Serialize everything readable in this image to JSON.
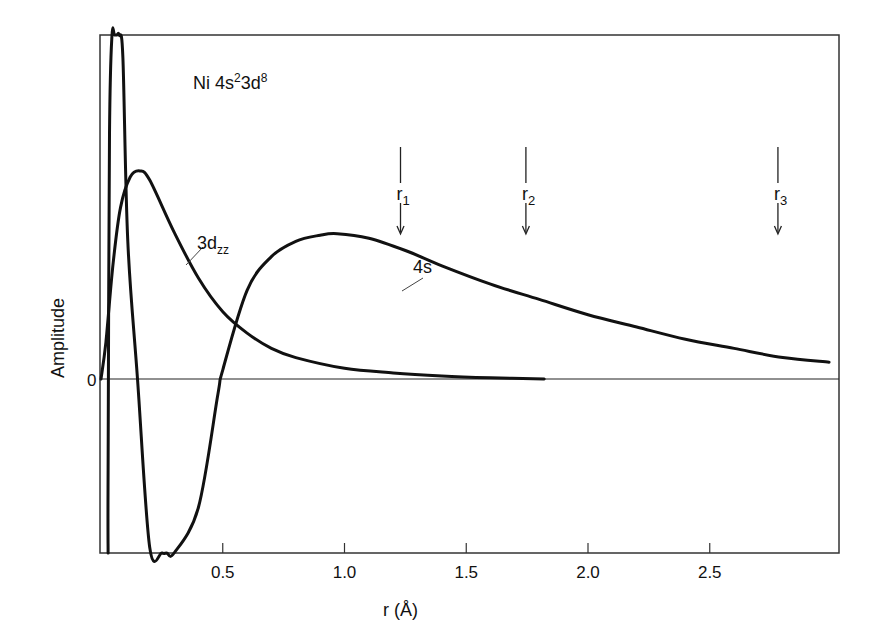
{
  "chart_data": {
    "type": "line",
    "title_parts": {
      "base": "Ni 4s",
      "sup1": "2",
      "mid": "3d",
      "sup2": "8"
    },
    "xlabel": "r (Å)",
    "ylabel": "Amplitude",
    "xlim": [
      0,
      3.0
    ],
    "ylim": [
      -1.0,
      1.64
    ],
    "x_ticks": [
      0.5,
      1.0,
      1.5,
      2.0,
      2.5
    ],
    "x_tick_labels": [
      "0.5",
      "1.0",
      "1.5",
      "2.0",
      "2.5"
    ],
    "y_ticks": [
      0
    ],
    "y_tick_labels": [
      "0"
    ],
    "grid": false,
    "legend": null,
    "zero_line": true,
    "series": [
      {
        "name": "4s",
        "label_text": "4s",
        "points": [
          [
            0.029,
            -1.0
          ],
          [
            0.029,
            -0.3
          ],
          [
            0.035,
            0.8
          ],
          [
            0.045,
            1.25
          ],
          [
            0.055,
            1.48
          ],
          [
            0.065,
            1.54
          ],
          [
            0.075,
            1.45
          ],
          [
            0.09,
            1.05
          ],
          [
            0.11,
            0.45
          ],
          [
            0.15,
            0.0
          ],
          [
            0.2,
            -0.55
          ],
          [
            0.25,
            -0.85
          ],
          [
            0.27,
            -0.9
          ],
          [
            0.3,
            -0.82
          ],
          [
            0.4,
            -0.42
          ],
          [
            0.48,
            -0.05
          ],
          [
            0.5,
            0.03
          ],
          [
            0.6,
            0.29
          ],
          [
            0.7,
            0.4
          ],
          [
            0.8,
            0.45
          ],
          [
            0.9,
            0.47
          ],
          [
            0.97,
            0.475
          ],
          [
            1.1,
            0.46
          ],
          [
            1.25,
            0.42
          ],
          [
            1.4,
            0.37
          ],
          [
            1.6,
            0.31
          ],
          [
            1.8,
            0.26
          ],
          [
            2.0,
            0.21
          ],
          [
            2.2,
            0.17
          ],
          [
            2.4,
            0.13
          ],
          [
            2.6,
            0.1
          ],
          [
            2.8,
            0.07
          ],
          [
            2.99,
            0.055
          ]
        ]
      },
      {
        "name": "3dzz",
        "label_text": "3d",
        "label_sub": "zz",
        "points": [
          [
            0.0,
            0.0
          ],
          [
            0.02,
            0.12
          ],
          [
            0.05,
            0.38
          ],
          [
            0.08,
            0.56
          ],
          [
            0.12,
            0.66
          ],
          [
            0.16,
            0.68
          ],
          [
            0.2,
            0.65
          ],
          [
            0.3,
            0.48
          ],
          [
            0.4,
            0.33
          ],
          [
            0.5,
            0.22
          ],
          [
            0.6,
            0.15
          ],
          [
            0.7,
            0.1
          ],
          [
            0.8,
            0.07
          ],
          [
            1.0,
            0.035
          ],
          [
            1.2,
            0.02
          ],
          [
            1.4,
            0.01
          ],
          [
            1.6,
            0.004
          ],
          [
            1.82,
            0.0
          ]
        ]
      }
    ],
    "annotations": [
      {
        "id": "r1",
        "label": "r",
        "sub": "1",
        "x": 1.23
      },
      {
        "id": "r2",
        "label": "r",
        "sub": "2",
        "x": 1.745
      },
      {
        "id": "r3",
        "label": "r",
        "sub": "3",
        "x": 2.78
      }
    ],
    "colors": {
      "line": "#111111",
      "frame": "#333333",
      "background": "#ffffff"
    }
  }
}
